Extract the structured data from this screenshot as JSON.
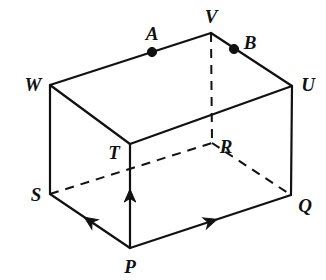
{
  "figure": {
    "type": "geometry-diagram",
    "shape": "rectangular-prism",
    "width": 326,
    "height": 280,
    "background_color": "#ffffff",
    "stroke_color": "#111111",
    "solid_stroke_width": 2.2,
    "dashed_stroke_width": 2.0,
    "dash_pattern": "9 7"
  },
  "vertices": [
    {
      "id": "P",
      "label": "P",
      "x": 130,
      "y": 248,
      "label_x": 130,
      "label_y": 266,
      "hidden": false
    },
    {
      "id": "Q",
      "label": "Q",
      "x": 291,
      "y": 195,
      "label_x": 305,
      "label_y": 205,
      "hidden": false
    },
    {
      "id": "R",
      "label": "R",
      "x": 212,
      "y": 143,
      "label_x": 226,
      "label_y": 146,
      "hidden": true
    },
    {
      "id": "S",
      "label": "S",
      "x": 50,
      "y": 194,
      "label_x": 36,
      "label_y": 194,
      "hidden": false
    },
    {
      "id": "T",
      "label": "T",
      "x": 130,
      "y": 144,
      "label_x": 114,
      "label_y": 152,
      "hidden": false
    },
    {
      "id": "U",
      "label": "U",
      "x": 292,
      "y": 86,
      "label_x": 308,
      "label_y": 84,
      "hidden": false
    },
    {
      "id": "V",
      "label": "V",
      "x": 211,
      "y": 33,
      "label_x": 211,
      "label_y": 16,
      "hidden": false
    },
    {
      "id": "W",
      "label": "W",
      "x": 50,
      "y": 85,
      "label_x": 33,
      "label_y": 84,
      "hidden": false
    }
  ],
  "marked_points": [
    {
      "id": "A",
      "label": "A",
      "x": 152,
      "y": 52,
      "label_x": 152,
      "label_y": 33,
      "on_edge": "W-V",
      "radius": 4.6
    },
    {
      "id": "B",
      "label": "B",
      "x": 234,
      "y": 49,
      "label_x": 250,
      "label_y": 42,
      "on_edge": "V-U",
      "radius": 4.6
    }
  ],
  "edges": [
    {
      "from": "W",
      "to": "V",
      "style": "solid"
    },
    {
      "from": "V",
      "to": "U",
      "style": "solid"
    },
    {
      "from": "W",
      "to": "T",
      "style": "solid"
    },
    {
      "from": "T",
      "to": "U",
      "style": "solid"
    },
    {
      "from": "W",
      "to": "S",
      "style": "solid"
    },
    {
      "from": "U",
      "to": "Q",
      "style": "solid"
    },
    {
      "from": "S",
      "to": "P",
      "style": "solid"
    },
    {
      "from": "P",
      "to": "Q",
      "style": "solid"
    },
    {
      "from": "P",
      "to": "T",
      "style": "solid"
    },
    {
      "from": "V",
      "to": "R",
      "style": "dashed"
    },
    {
      "from": "S",
      "to": "R",
      "style": "dashed"
    },
    {
      "from": "R",
      "to": "Q",
      "style": "dashed"
    }
  ],
  "arrows": [
    {
      "id": "arrow-P-S",
      "from": "P",
      "to": "S",
      "t": 0.5,
      "direction": "toward-S",
      "size": 11
    },
    {
      "id": "arrow-P-Q",
      "from": "P",
      "to": "Q",
      "t": 0.5,
      "direction": "toward-Q",
      "size": 11
    },
    {
      "id": "arrow-P-T",
      "from": "P",
      "to": "T",
      "t": 0.5,
      "direction": "toward-T",
      "size": 11
    }
  ]
}
